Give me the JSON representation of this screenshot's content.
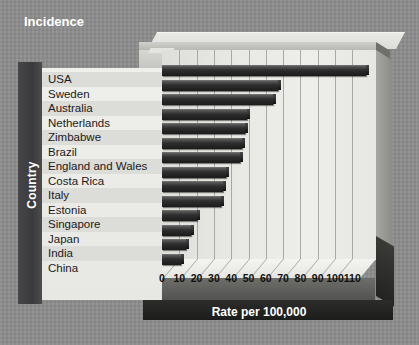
{
  "title": "Incidence",
  "axis": {
    "ylabel": "Country",
    "xlabel": "Rate per 100,000"
  },
  "chart_data": {
    "type": "bar",
    "orientation": "horizontal",
    "title": "Incidence",
    "xlabel": "Rate per 100,000",
    "ylabel": "Country",
    "xlim": [
      0,
      118
    ],
    "xticks": [
      0,
      10,
      20,
      30,
      40,
      50,
      60,
      70,
      80,
      90,
      100,
      110
    ],
    "grid": true,
    "legend": false,
    "bar_color": "#252525",
    "categories": [
      "USA",
      "Sweden",
      "Australia",
      "Netherlands",
      "Zimbabwe",
      "Brazil",
      "England and Wales",
      "Costa Rica",
      "Italy",
      "Estonia",
      "Singapore",
      "Japan",
      "India",
      "China"
    ],
    "values": [
      118,
      67,
      64,
      49,
      48,
      46,
      45,
      37,
      35,
      34,
      20,
      17,
      14,
      11
    ]
  }
}
